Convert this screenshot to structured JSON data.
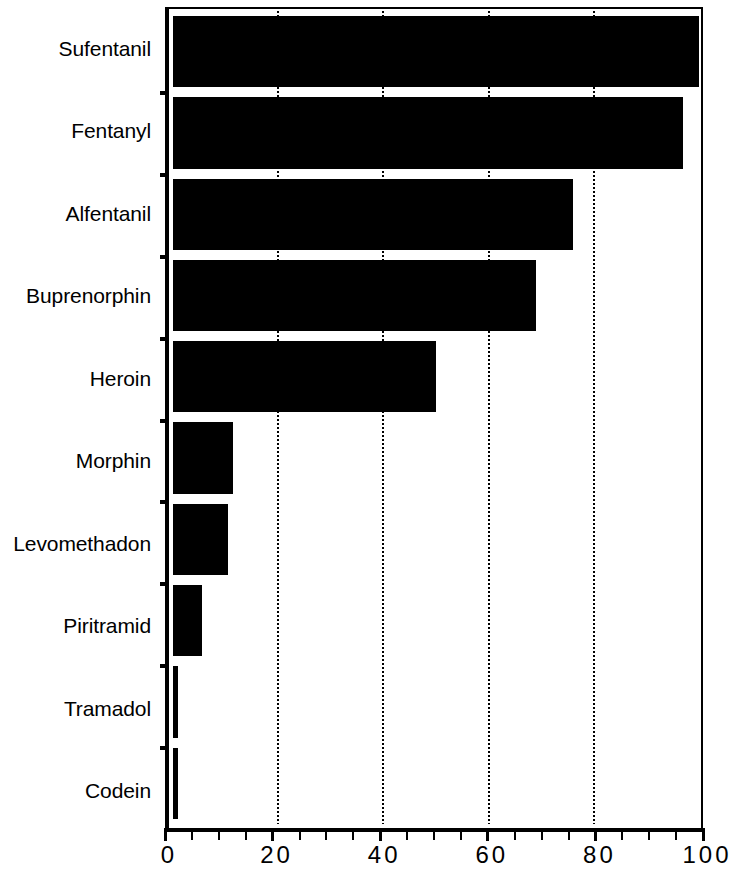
{
  "chart_data": {
    "type": "bar",
    "orientation": "horizontal",
    "title": "",
    "subtitle": "",
    "xlabel": "",
    "ylabel": "",
    "xlim": [
      0,
      100
    ],
    "ylim": null,
    "grid": true,
    "grid_axis": "x",
    "legend": null,
    "legend_position": "none",
    "bar_color": "#000000",
    "background_color": "#ffffff",
    "axis_color": "#000000",
    "categories": [
      "Sufentanil",
      "Fentanyl",
      "Alfentanil",
      "Buprenorphin",
      "Heroin",
      "Morphin",
      "Levomethadon",
      "Piritramid",
      "Tramadol",
      "Codein"
    ],
    "values": [
      100,
      97,
      76,
      69,
      50,
      11.5,
      10.5,
      5.5,
      1,
      1
    ],
    "xticks": [
      0,
      20,
      40,
      60,
      80,
      100
    ],
    "xtick_labels": [
      "0",
      "20",
      "40",
      "60",
      "80",
      "100"
    ],
    "xminor_ticks": [
      5,
      10,
      15,
      25,
      30,
      35,
      45,
      50,
      55,
      65,
      70,
      75,
      85,
      90,
      95
    ],
    "gridline_values": [
      20,
      40,
      60,
      80
    ]
  }
}
